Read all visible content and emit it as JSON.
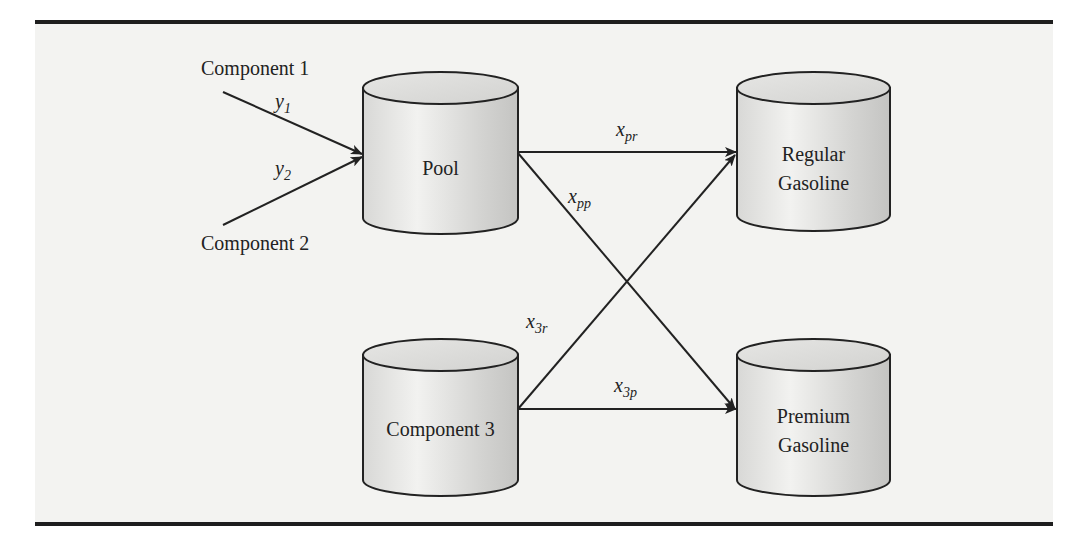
{
  "diagram": {
    "sources": [
      {
        "id": "component-1",
        "label": "Component 1"
      },
      {
        "id": "component-2",
        "label": "Component 2"
      }
    ],
    "tanks": [
      {
        "id": "pool",
        "lines": [
          "Pool"
        ]
      },
      {
        "id": "component-3",
        "lines": [
          "Component 3"
        ]
      },
      {
        "id": "regular-gasoline",
        "lines": [
          "Regular",
          "Gasoline"
        ]
      },
      {
        "id": "premium-gasoline",
        "lines": [
          "Premium",
          "Gasoline"
        ]
      }
    ],
    "flows": [
      {
        "id": "y1",
        "base": "y",
        "sub": "1",
        "from": "Component 1",
        "to": "Pool"
      },
      {
        "id": "y2",
        "base": "y",
        "sub": "2",
        "from": "Component 2",
        "to": "Pool"
      },
      {
        "id": "xpr",
        "base": "x",
        "sub": "pr",
        "from": "Pool",
        "to": "Regular Gasoline"
      },
      {
        "id": "xpp",
        "base": "x",
        "sub": "pp",
        "from": "Pool",
        "to": "Premium Gasoline"
      },
      {
        "id": "x3r",
        "base": "x",
        "sub": "3r",
        "from": "Component 3",
        "to": "Regular Gasoline"
      },
      {
        "id": "x3p",
        "base": "x",
        "sub": "3p",
        "from": "Component 3",
        "to": "Premium Gasoline"
      }
    ]
  }
}
